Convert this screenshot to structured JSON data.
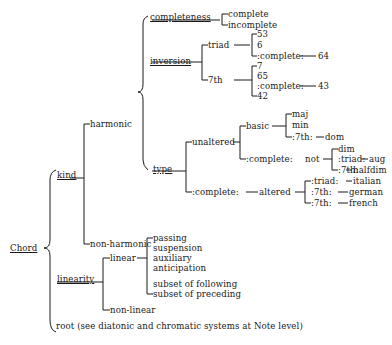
{
  "diagram": {
    "root": "Chord",
    "branches": {
      "kind": "kind",
      "harmonic": "harmonic",
      "non_harmonic": "non-harmonic",
      "completeness": "completeness",
      "complete": "complete",
      "incomplete": "incomplete",
      "inversion": "inversion",
      "triad": "triad",
      "triad_items": [
        "53",
        "6",
        ":complete:",
        "64"
      ],
      "seventh": "7th",
      "seventh_items": [
        "7",
        "65",
        ":complete:",
        "43",
        "42"
      ],
      "type": "type",
      "unaltered": "unaltered",
      "basic": "basic",
      "basic_items": [
        "maj",
        "min",
        ":7th:",
        "dom"
      ],
      "complete_not": ":complete:",
      "not": "not",
      "not_items": [
        "dim",
        ":triad:",
        "aug",
        ":7th:",
        "halfdim"
      ],
      "complete_altered": ":complete:",
      "altered": "altered",
      "altered_items": [
        ":triad:",
        "italian",
        ":7th:",
        "german",
        ":7th:",
        "french"
      ],
      "linearity": "linearity",
      "linear": "linear",
      "linear_items": [
        "passing",
        "suspension",
        "auxiliary",
        "anticipation",
        "subset of following",
        "subset of preceding"
      ],
      "non_linear": "non-linear",
      "root": "root (see diatonic and chromatic systems at Note level)"
    }
  }
}
